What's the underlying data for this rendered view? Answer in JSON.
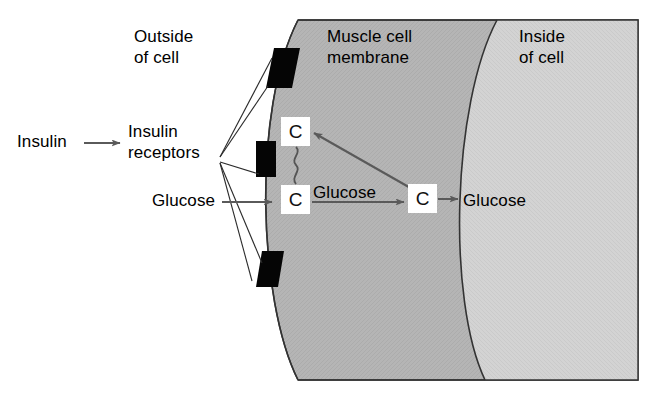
{
  "diagram": {
    "title_context": "Insulin-mediated glucose transport across a muscle cell membrane",
    "labels": {
      "outside_of_cell": "Outside\nof cell",
      "insulin": "Insulin",
      "insulin_receptors": "Insulin\nreceptors",
      "glucose_outside": "Glucose",
      "muscle_cell_membrane": "Muscle cell\nmembrane",
      "inside_of_cell": "Inside\nof cell",
      "glucose_transport": "Glucose",
      "glucose_inside": "Glucose"
    },
    "carriers": {
      "carrier_top_label": "C",
      "carrier_bottom_label": "C",
      "carrier_inner_label": "C"
    },
    "receptors": {
      "count": 3,
      "shape": "parallelogram",
      "color": "#050505"
    },
    "colors": {
      "outside_background": "#ffffff",
      "membrane_fill": "#b4b4b4",
      "cytoplasm_fill": "#d2d2d2",
      "outline": "#333333",
      "arrow": "#5a5a5a",
      "leader_line": "#2b2b2b",
      "text": "#000000",
      "carrier_box": "#ffffff"
    },
    "arrows": {
      "insulin_arrow": "right",
      "glucose_entry_arrow": "right",
      "glucose_transport_arrow": "right",
      "carrier_recycle_arrow": "up-left",
      "glucose_release_arrow": "right"
    },
    "connectors": {
      "carrier_link": "wavy-line"
    }
  }
}
